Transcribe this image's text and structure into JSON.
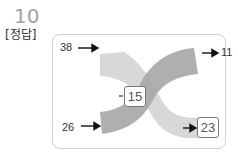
{
  "question": {
    "number": "10",
    "label": "[정답]"
  },
  "diagram": {
    "top_left_input": "38",
    "top_right_output": "11",
    "center_value": "15",
    "bottom_left_input": "26",
    "bottom_right_output": "23",
    "colors": {
      "light_band": "#d6d6d6",
      "dark_band": "#a9a9a9",
      "overlap": "#8f8f8f",
      "arrow": "#111111"
    }
  }
}
